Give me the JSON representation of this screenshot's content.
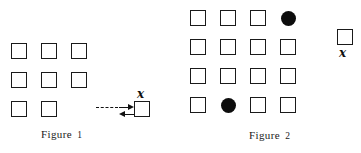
{
  "page": {
    "background_color": "#ffffff",
    "ink_color": "#111111",
    "width": 361,
    "height": 153
  },
  "figures": [
    {
      "id": "figure-1",
      "caption_word": "Figure",
      "caption_number": "1",
      "caption_x": 41,
      "caption_y": 128,
      "grid": {
        "origin_x": 11,
        "origin_y": 43,
        "pitch_x": 30,
        "pitch_y": 29,
        "rows": 3,
        "cols": 3,
        "cells": [
          {
            "row": 0,
            "col": 0,
            "shape": "square"
          },
          {
            "row": 0,
            "col": 1,
            "shape": "square"
          },
          {
            "row": 0,
            "col": 2,
            "shape": "square"
          },
          {
            "row": 1,
            "col": 0,
            "shape": "square"
          },
          {
            "row": 1,
            "col": 1,
            "shape": "square"
          },
          {
            "row": 1,
            "col": 2,
            "shape": "square"
          },
          {
            "row": 2,
            "col": 0,
            "shape": "square"
          },
          {
            "row": 2,
            "col": 1,
            "shape": "square"
          }
        ]
      },
      "detached_cell": {
        "shape": "square",
        "x": 134,
        "y": 101,
        "label": "x",
        "label_position": "above",
        "label_x": 137,
        "label_y": 88
      },
      "connector": {
        "type": "bidirectional",
        "dashed_line": {
          "x": 96,
          "y": 107,
          "length": 22
        },
        "forward_arrow": {
          "x": 119,
          "y": 107,
          "length": 9,
          "direction": "right"
        },
        "return_arrow": {
          "x": 119,
          "y": 114,
          "length": 9,
          "direction": "left"
        }
      }
    },
    {
      "id": "figure-2",
      "caption_word": "Figure",
      "caption_number": "2",
      "caption_x": 249,
      "caption_y": 129,
      "grid": {
        "origin_x": 190,
        "origin_y": 10,
        "pitch_x": 30,
        "pitch_y": 29,
        "rows": 4,
        "cols": 4,
        "cells": [
          {
            "row": 0,
            "col": 0,
            "shape": "square"
          },
          {
            "row": 0,
            "col": 1,
            "shape": "square"
          },
          {
            "row": 0,
            "col": 2,
            "shape": "square"
          },
          {
            "row": 0,
            "col": 3,
            "shape": "disc"
          },
          {
            "row": 1,
            "col": 0,
            "shape": "square"
          },
          {
            "row": 1,
            "col": 1,
            "shape": "square"
          },
          {
            "row": 1,
            "col": 2,
            "shape": "square"
          },
          {
            "row": 1,
            "col": 3,
            "shape": "square"
          },
          {
            "row": 2,
            "col": 0,
            "shape": "square"
          },
          {
            "row": 2,
            "col": 1,
            "shape": "square"
          },
          {
            "row": 2,
            "col": 2,
            "shape": "square"
          },
          {
            "row": 2,
            "col": 3,
            "shape": "square"
          },
          {
            "row": 3,
            "col": 0,
            "shape": "square"
          },
          {
            "row": 3,
            "col": 1,
            "shape": "disc"
          },
          {
            "row": 3,
            "col": 2,
            "shape": "square"
          },
          {
            "row": 3,
            "col": 3,
            "shape": "square"
          }
        ]
      },
      "detached_cell": {
        "shape": "square",
        "x": 337,
        "y": 29,
        "label": "x",
        "label_position": "below",
        "label_x": 339,
        "label_y": 47
      },
      "connector": null
    }
  ]
}
